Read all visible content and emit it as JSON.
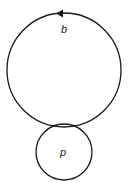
{
  "diagram": {
    "type": "two tangent circles",
    "stroke_color": "#1a1a1a",
    "background": "#ffffff",
    "big_circle": {
      "label": "b",
      "cx": 64,
      "cy": 70,
      "r": 57,
      "arrow": "counterclockwise arrowhead at top"
    },
    "small_circle": {
      "label": "p",
      "cx": 64,
      "cy": 152,
      "r": 28
    },
    "tangent_point": [
      64,
      125
    ]
  }
}
